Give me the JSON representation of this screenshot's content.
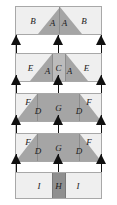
{
  "diagram": {
    "width": 117,
    "height": 205,
    "background": "#ffffff",
    "colors": {
      "light": "#efefef",
      "medium": "#c7c7c7",
      "dark": "#a5a5a5",
      "darkest": "#8f8f8f",
      "outline": "#a8a8a8",
      "rail": "#b9b9b9",
      "arrow": "#111111",
      "label_text": "#1b1b1b"
    },
    "bands": [
      {
        "name": "band-1",
        "top": 6,
        "height": 29,
        "regions": [
          {
            "label": "B",
            "x": 20,
            "y": 52,
            "fill": "light"
          },
          {
            "label": "A",
            "x": 43,
            "y": 60,
            "fill": "dark"
          },
          {
            "label": "A",
            "x": 57,
            "y": 60,
            "fill": "dark"
          },
          {
            "label": "B",
            "x": 80,
            "y": 52,
            "fill": "light"
          }
        ]
      },
      {
        "name": "band-2",
        "top": 53,
        "height": 29,
        "regions": [
          {
            "label": "E",
            "x": 17,
            "y": 50,
            "fill": "light"
          },
          {
            "label": "A",
            "x": 37,
            "y": 62,
            "fill": "dark"
          },
          {
            "label": "C",
            "x": 50,
            "y": 50,
            "fill": "medium"
          },
          {
            "label": "A",
            "x": 63,
            "y": 62,
            "fill": "dark"
          },
          {
            "label": "E",
            "x": 83,
            "y": 50,
            "fill": "light"
          }
        ]
      },
      {
        "name": "band-3",
        "top": 93,
        "height": 29,
        "regions": [
          {
            "label": "F",
            "x": 14,
            "y": 30,
            "fill": "light"
          },
          {
            "label": "D",
            "x": 26,
            "y": 62,
            "fill": "dark"
          },
          {
            "label": "G",
            "x": 50,
            "y": 50,
            "fill": "dark"
          },
          {
            "label": "D",
            "x": 74,
            "y": 62,
            "fill": "dark"
          },
          {
            "label": "F",
            "x": 86,
            "y": 30,
            "fill": "light"
          }
        ]
      },
      {
        "name": "band-4",
        "top": 133,
        "height": 29,
        "regions": [
          {
            "label": "F",
            "x": 14,
            "y": 30,
            "fill": "light"
          },
          {
            "label": "D",
            "x": 26,
            "y": 62,
            "fill": "dark"
          },
          {
            "label": "G",
            "x": 50,
            "y": 50,
            "fill": "dark"
          },
          {
            "label": "D",
            "x": 74,
            "y": 62,
            "fill": "dark"
          },
          {
            "label": "F",
            "x": 86,
            "y": 30,
            "fill": "light"
          }
        ]
      },
      {
        "name": "band-5",
        "top": 172,
        "height": 27,
        "regions": [
          {
            "label": "I",
            "x": 27,
            "y": 52,
            "fill": "light"
          },
          {
            "label": "H",
            "x": 50,
            "y": 52,
            "fill": "darkest"
          },
          {
            "label": "I",
            "x": 73,
            "y": 52,
            "fill": "light"
          }
        ]
      }
    ],
    "arrow_rows": [
      {
        "name": "arrow-row-1",
        "top": 35,
        "arrows_x": [
          11,
          53,
          96
        ]
      },
      {
        "name": "arrow-row-2",
        "top": 75,
        "arrows_x": [
          11,
          53,
          96
        ]
      },
      {
        "name": "arrow-row-3",
        "top": 115,
        "arrows_x": [
          11,
          53,
          96
        ]
      },
      {
        "name": "arrow-row-4",
        "top": 154,
        "arrows_x": [
          11,
          53,
          96
        ]
      }
    ],
    "legend_labels": [
      "A",
      "B",
      "C",
      "D",
      "E",
      "F",
      "G",
      "H",
      "I"
    ]
  }
}
